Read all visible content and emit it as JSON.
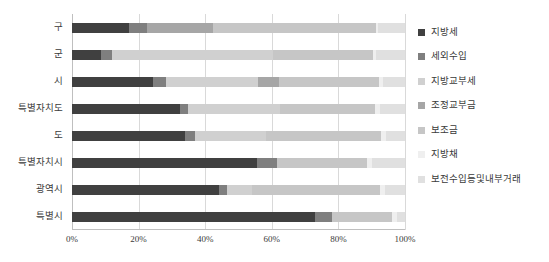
{
  "chart_data": {
    "type": "bar",
    "orientation": "horizontal",
    "stacked": "100%",
    "title": "",
    "xlabel": "",
    "ylabel": "",
    "xlim": [
      0,
      100
    ],
    "xticks": [
      "0%",
      "20%",
      "40%",
      "60%",
      "80%",
      "100%"
    ],
    "xtick_values": [
      0,
      20,
      40,
      60,
      80,
      100
    ],
    "grid": true,
    "legend_position": "right",
    "categories": [
      "구",
      "군",
      "시",
      "특별자치도",
      "도",
      "특별자치시",
      "광역시",
      "특별시"
    ],
    "series": [
      {
        "name": "지방세",
        "color": "#404040",
        "values": [
          17.0,
          8.7,
          24.3,
          32.4,
          34.0,
          55.5,
          44.0,
          73.0
        ]
      },
      {
        "name": "세외수입",
        "color": "#7f7f7f",
        "values": [
          5.5,
          3.3,
          4.0,
          2.5,
          2.8,
          6.0,
          2.5,
          5.0
        ]
      },
      {
        "name": "지방교부세",
        "color": "#d0d0d0",
        "values": [
          0.0,
          48.5,
          27.5,
          27.5,
          21.5,
          0.0,
          7.5,
          0.0
        ]
      },
      {
        "name": "조정교부금",
        "color": "#a6a6a6",
        "values": [
          19.8,
          0.0,
          6.5,
          0.0,
          0.0,
          0.0,
          0.0,
          0.0
        ]
      },
      {
        "name": "보조금",
        "color": "#c6c6c6",
        "values": [
          49.0,
          30.0,
          30.0,
          28.5,
          34.5,
          27.0,
          38.5,
          18.0
        ]
      },
      {
        "name": "지방채",
        "color": "#efefef",
        "values": [
          0.5,
          0.8,
          1.2,
          1.6,
          1.5,
          1.5,
          1.5,
          1.5
        ]
      },
      {
        "name": "보전수입등및내부거래",
        "color": "#e0e0e0",
        "values": [
          8.2,
          8.7,
          6.5,
          7.5,
          5.7,
          10.0,
          6.0,
          2.5
        ]
      }
    ]
  },
  "legend": {
    "items": [
      {
        "label": "지방세",
        "color": "#404040"
      },
      {
        "label": "세외수입",
        "color": "#7f7f7f"
      },
      {
        "label": "지방교부세",
        "color": "#d0d0d0"
      },
      {
        "label": "조정교부금",
        "color": "#a6a6a6"
      },
      {
        "label": "보조금",
        "color": "#c6c6c6"
      },
      {
        "label": "지방채",
        "color": "#efefef"
      },
      {
        "label": "보전수입등및내부거래",
        "color": "#e0e0e0"
      }
    ]
  }
}
